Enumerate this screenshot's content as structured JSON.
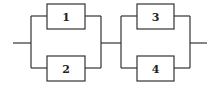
{
  "diagram": {
    "type": "reliability-block-diagram",
    "stroke_color": "#333333",
    "background": "#ffffff",
    "stages": [
      {
        "name": "stage-1",
        "blocks": [
          "1",
          "2"
        ]
      },
      {
        "name": "stage-2",
        "blocks": [
          "3",
          "4"
        ]
      }
    ],
    "blocks": {
      "b1": {
        "label": "1"
      },
      "b2": {
        "label": "2"
      },
      "b3": {
        "label": "3"
      },
      "b4": {
        "label": "4"
      }
    }
  }
}
